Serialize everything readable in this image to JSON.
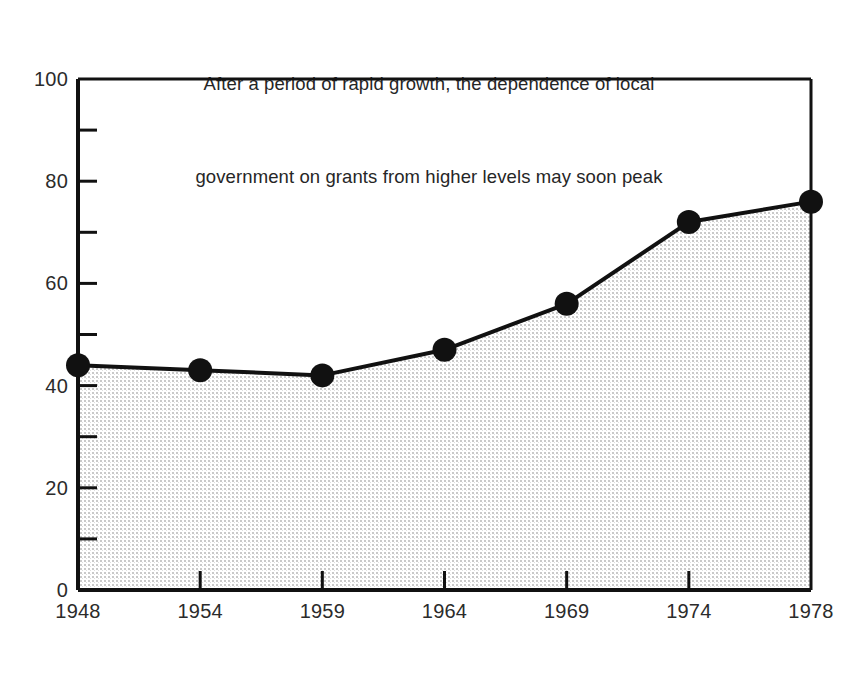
{
  "chart_data": {
    "type": "area",
    "title": "After a period of rapid growth, the dependence of local government on grants from higher levels may soon peak",
    "title_lines": [
      "After a period of rapid growth, the dependence of local",
      "government on grants from higher levels may soon peak"
    ],
    "xlabel": "",
    "ylabel": "",
    "categories": [
      "1948",
      "1954",
      "1959",
      "1964",
      "1969",
      "1974",
      "1978"
    ],
    "values": [
      44,
      43,
      42,
      47,
      56,
      72,
      76
    ],
    "series": [
      {
        "name": "Dependence of local government on grants from higher levels",
        "values": [
          44,
          43,
          42,
          47,
          56,
          72,
          76
        ]
      }
    ],
    "ylim": [
      0,
      100
    ],
    "y_major_ticks": [
      0,
      20,
      40,
      60,
      80,
      100
    ],
    "y_major_tick_labels": [
      "0",
      "20",
      "40",
      "60",
      "80",
      "100"
    ],
    "y_minor_ticks": [
      10,
      30,
      50,
      70,
      90
    ],
    "grid": false,
    "legend": false,
    "legend_position": "none",
    "marker": "filled-circle",
    "fill": "stipple-gray",
    "colors": {
      "line": "#111111",
      "marker": "#111111",
      "axis": "#111111",
      "fill": "#d8d8d8",
      "text": "#2b2b2b",
      "background": "#ffffff"
    }
  }
}
